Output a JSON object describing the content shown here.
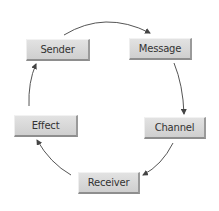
{
  "diagram": {
    "type": "cycle",
    "nodes": [
      {
        "id": "sender",
        "label": "Sender"
      },
      {
        "id": "message",
        "label": "Message"
      },
      {
        "id": "channel",
        "label": "Channel"
      },
      {
        "id": "receiver",
        "label": "Receiver"
      },
      {
        "id": "effect",
        "label": "Effect"
      }
    ],
    "edges": [
      {
        "from": "sender",
        "to": "message"
      },
      {
        "from": "message",
        "to": "channel"
      },
      {
        "from": "channel",
        "to": "receiver"
      },
      {
        "from": "receiver",
        "to": "effect"
      },
      {
        "from": "effect",
        "to": "sender"
      }
    ],
    "colors": {
      "box": "#d6d6d6",
      "text": "#333333",
      "arrow": "#444444"
    }
  }
}
